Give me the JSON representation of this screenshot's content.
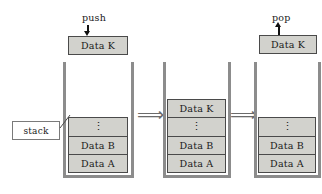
{
  "diagram": {
    "colors": {
      "cell_fill": "#d2d2cd",
      "cell_border": "#4a4a4a",
      "wall": "#8c8c8c",
      "arrow": "#111111",
      "implies": "#6b6b6b",
      "background": "#ffffff"
    },
    "callout": {
      "label": "stack"
    },
    "transitions": [
      {
        "symbol": "⟹"
      },
      {
        "symbol": "⟹"
      }
    ],
    "panels": [
      {
        "id": "panel-push",
        "operation": "push",
        "operation_label": "push",
        "arrow_direction": "down",
        "floating_item": "Data K",
        "cells": [
          "⋮",
          "Data B",
          "Data A"
        ]
      },
      {
        "id": "panel-after-push",
        "operation": "",
        "operation_label": "",
        "arrow_direction": "none",
        "floating_item": "",
        "cells": [
          "Data K",
          "⋮",
          "Data B",
          "Data A"
        ]
      },
      {
        "id": "panel-pop",
        "operation": "pop",
        "operation_label": "pop",
        "arrow_direction": "up",
        "floating_item": "Data K",
        "cells": [
          "⋮",
          "Data B",
          "Data A"
        ]
      }
    ]
  }
}
